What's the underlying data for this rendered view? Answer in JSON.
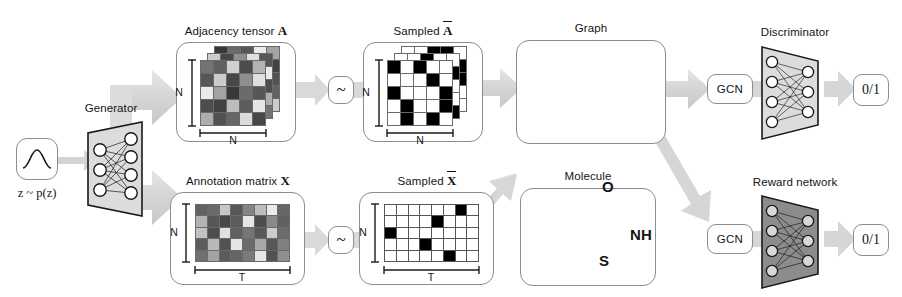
{
  "figure": {
    "background": "#ffffff"
  },
  "colors": {
    "arrow_gray": "#d2d2d2",
    "panel_border": "#8d8d8d",
    "generator_fill": "#dcdcdc",
    "discriminator_fill": "#dcdcdc",
    "reward_fill": "#8c8c8c",
    "node_fill": "#d0d0d0",
    "ink": "#141414"
  },
  "blocks": {
    "prior": {
      "name": "prior-distribution",
      "label": "z ~ p(z)",
      "icon": "gaussian-curve-icon"
    },
    "generator": {
      "caption": "Generator",
      "type": "mlp-trapezoid",
      "layers": [
        3,
        4
      ],
      "direction": "expanding",
      "fill": "#dcdcdc"
    },
    "adjacency": {
      "caption_text": "Adjacency tensor",
      "caption_symbol": "A",
      "rows_label": "N",
      "cols_label": "N",
      "grid_rows": 5,
      "grid_cols": 5,
      "depth": 3,
      "style": "grayscale"
    },
    "sampled_adjacency": {
      "caption_text": "Sampled",
      "caption_symbol": "A",
      "caption_symbol_overline": true,
      "rows_label": "N",
      "cols_label": "N",
      "grid_rows": 5,
      "grid_cols": 5,
      "depth": 3,
      "style": "binary"
    },
    "annotation": {
      "caption_text": "Annotation matrix",
      "caption_symbol": "X",
      "rows_label": "N",
      "cols_label": "T",
      "grid_rows": 5,
      "grid_cols": 8,
      "style": "grayscale"
    },
    "sampled_annotation": {
      "caption_text": "Sampled",
      "caption_symbol": "X",
      "caption_symbol_overline": true,
      "rows_label": "N",
      "cols_label": "T",
      "grid_rows": 5,
      "grid_cols": 8,
      "style": "one-hot"
    },
    "graph": {
      "caption": "Graph",
      "node_count": 10
    },
    "molecule": {
      "caption": "Molecule",
      "name": "benzisothiazolinone",
      "atom_labels": [
        "O",
        "NH",
        "S"
      ]
    },
    "gcn_top": {
      "label": "GCN"
    },
    "gcn_bottom": {
      "label": "GCN"
    },
    "discriminator": {
      "caption": "Discriminator",
      "type": "mlp-trapezoid",
      "layers": [
        4,
        3
      ],
      "direction": "contracting",
      "fill": "#dcdcdc"
    },
    "reward": {
      "caption": "Reward network",
      "type": "mlp-trapezoid",
      "layers": [
        4,
        3
      ],
      "direction": "contracting",
      "fill": "#8c8c8c"
    },
    "output_top": {
      "label": "0/1"
    },
    "output_bottom": {
      "label": "0/1"
    },
    "sampler_top": {
      "label": "~"
    },
    "sampler_bottom": {
      "label": "~"
    }
  },
  "chart_data": {
    "type": "diagram",
    "adjacency_tensor_values": [
      [
        0.55,
        0.62,
        0.18,
        0.7,
        0.3
      ],
      [
        0.66,
        0.2,
        0.72,
        0.44,
        0.12
      ],
      [
        0.08,
        0.36,
        0.78,
        0.58,
        0.66
      ],
      [
        0.7,
        0.74,
        0.26,
        0.64,
        0.1
      ],
      [
        0.32,
        0.68,
        0.6,
        0.14,
        0.72
      ]
    ],
    "sampled_adjacency_values": [
      [
        1,
        0,
        1,
        0,
        0
      ],
      [
        0,
        0,
        0,
        1,
        0
      ],
      [
        1,
        0,
        0,
        0,
        1
      ],
      [
        0,
        1,
        0,
        0,
        1
      ],
      [
        0,
        1,
        0,
        1,
        0
      ]
    ],
    "annotation_matrix_values": [
      [
        0.62,
        0.58,
        0.22,
        0.66,
        0.48,
        0.26,
        0.08,
        0.6
      ],
      [
        0.3,
        0.66,
        0.72,
        0.64,
        0.1,
        0.7,
        0.46,
        0.62
      ],
      [
        0.24,
        0.7,
        0.12,
        0.62,
        0.54,
        0.66,
        0.2,
        0.58
      ],
      [
        0.64,
        0.28,
        0.68,
        0.1,
        0.58,
        0.34,
        0.66,
        0.5
      ],
      [
        0.56,
        0.36,
        0.64,
        0.6,
        0.52,
        0.1,
        0.68,
        0.44
      ]
    ],
    "sampled_annotation_onehot": [
      6,
      4,
      0,
      3,
      5
    ],
    "graph_nodes": [
      {
        "id": 0,
        "x": 0.2,
        "y": 0.46
      },
      {
        "id": 1,
        "x": 0.2,
        "y": 0.68
      },
      {
        "id": 2,
        "x": 0.33,
        "y": 0.31
      },
      {
        "id": 3,
        "x": 0.34,
        "y": 0.82
      },
      {
        "id": 4,
        "x": 0.47,
        "y": 0.47
      },
      {
        "id": 5,
        "x": 0.49,
        "y": 0.78
      },
      {
        "id": 6,
        "x": 0.62,
        "y": 0.36
      },
      {
        "id": 7,
        "x": 0.62,
        "y": 0.72
      },
      {
        "id": 8,
        "x": 0.75,
        "y": 0.54
      },
      {
        "id": 9,
        "x": 0.73,
        "y": 0.18
      }
    ],
    "graph_edges": [
      [
        0,
        1
      ],
      [
        0,
        2
      ],
      [
        2,
        4
      ],
      [
        1,
        3
      ],
      [
        3,
        5
      ],
      [
        4,
        5
      ],
      [
        4,
        6
      ],
      [
        6,
        9
      ],
      [
        6,
        8
      ],
      [
        8,
        7
      ],
      [
        7,
        5
      ]
    ]
  }
}
